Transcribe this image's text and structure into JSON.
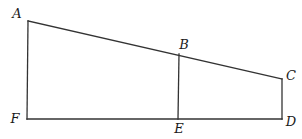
{
  "figure": {
    "kind": "geometry-diagram",
    "background_color": "#ffffff",
    "line_color": "#333333",
    "label_color": "#1a1a1a",
    "points": [
      {
        "label": "A",
        "x": 28,
        "y": 21,
        "label_x": 17,
        "label_y": 18,
        "anchor": "middle"
      },
      {
        "label": "B",
        "x": 179,
        "y": 54,
        "label_x": 184,
        "label_y": 49,
        "anchor": "middle"
      },
      {
        "label": "C",
        "x": 282,
        "y": 79,
        "label_x": 291,
        "label_y": 80,
        "anchor": "middle"
      },
      {
        "label": "D",
        "x": 282,
        "y": 119,
        "label_x": 291,
        "label_y": 126,
        "anchor": "middle"
      },
      {
        "label": "E",
        "x": 178,
        "y": 119,
        "label_x": 179,
        "label_y": 133,
        "anchor": "middle"
      },
      {
        "label": "F",
        "x": 27,
        "y": 119,
        "label_x": 15,
        "label_y": 123,
        "anchor": "middle"
      }
    ],
    "edges": [
      {
        "from": "A",
        "to": "C"
      },
      {
        "from": "A",
        "to": "F"
      },
      {
        "from": "F",
        "to": "D"
      },
      {
        "from": "C",
        "to": "D"
      },
      {
        "from": "B",
        "to": "E"
      }
    ],
    "stroke_width": 1.3
  }
}
